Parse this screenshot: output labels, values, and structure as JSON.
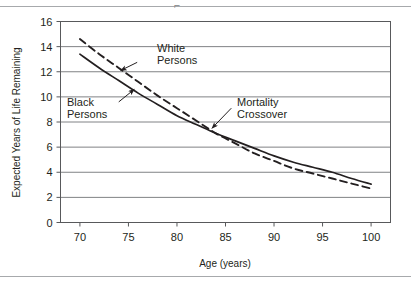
{
  "figure": {
    "rule_top": "top-divider-rule",
    "rule_bottom": "bottom-divider-rule",
    "corner_mark": "⌐"
  },
  "chart_data": {
    "type": "line",
    "title": "",
    "xlabel": "Age (years)",
    "ylabel": "Expected Years of Life Remaining",
    "xlim": [
      68,
      102
    ],
    "ylim": [
      0,
      16
    ],
    "xticks": [
      70,
      75,
      80,
      85,
      90,
      95,
      100
    ],
    "yticks": [
      0,
      2,
      4,
      6,
      8,
      10,
      12,
      14,
      16
    ],
    "grid": "horizontal",
    "legend_position": "inline-annotations",
    "x": [
      70,
      72,
      74,
      76,
      78,
      80,
      82,
      84,
      86,
      88,
      90,
      92,
      94,
      96,
      98,
      100
    ],
    "series": [
      {
        "name": "Black Persons",
        "style": "solid",
        "color": "#231f20",
        "values": [
          13.4,
          12.3,
          11.3,
          10.3,
          9.4,
          8.5,
          7.8,
          7.1,
          6.5,
          5.9,
          5.3,
          4.8,
          4.4,
          4.0,
          3.5,
          3.05
        ]
      },
      {
        "name": "White Persons",
        "style": "dashed",
        "color": "#231f20",
        "values": [
          14.6,
          13.4,
          12.3,
          11.2,
          10.1,
          9.1,
          8.1,
          7.1,
          6.3,
          5.5,
          4.9,
          4.3,
          3.9,
          3.5,
          3.1,
          2.7
        ]
      }
    ],
    "annotations": [
      {
        "id": "white-persons",
        "text": "White\nPersons",
        "arrow_from": [
          75.9,
          12.75
        ],
        "arrow_to": [
          74.2,
          12.1
        ]
      },
      {
        "id": "black-persons",
        "text": "Black\nPersons",
        "arrow_from": [
          74.0,
          9.6
        ],
        "arrow_to": [
          75.6,
          10.6
        ]
      },
      {
        "id": "mortality-crossover",
        "text": "Mortality\nCrossover",
        "arrow_from": [
          85.6,
          9.1
        ],
        "arrow_to": [
          83.6,
          7.5
        ]
      }
    ]
  }
}
